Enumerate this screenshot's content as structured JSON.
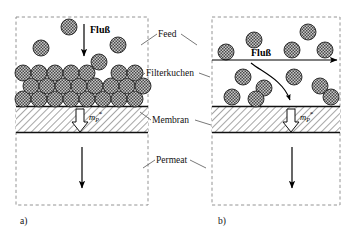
{
  "figure": {
    "title_present": false,
    "background_color": "#ffffff",
    "ink_color": "#111111",
    "panels": [
      {
        "id": "a",
        "caption": "a)",
        "box": {
          "x": 16,
          "y": 17,
          "w": 132,
          "h": 188
        },
        "flux_label": "Fluß",
        "flux_direction": "down",
        "mass_flow_label": {
          "symbol": "m",
          "subscript": "P",
          "superscript": "*"
        },
        "membrane": {
          "top": 106,
          "bottom": 133
        },
        "cake_rows": 3,
        "free_particles": 5
      },
      {
        "id": "b",
        "caption": "b)",
        "box": {
          "x": 212,
          "y": 17,
          "w": 128,
          "h": 188
        },
        "flux_label": "Fluß",
        "flux_direction": "right",
        "mass_flow_label": {
          "symbol": "m",
          "subscript": "P",
          "superscript": "*"
        },
        "membrane": {
          "top": 106,
          "bottom": 133
        },
        "cake_rows": 0,
        "free_particles": 13
      }
    ],
    "annotations": [
      {
        "name": "feed",
        "text": "Feed",
        "x": 158,
        "y": 37
      },
      {
        "name": "filterkuchen",
        "text": "Filterkuchen",
        "x": 146,
        "y": 76
      },
      {
        "name": "membran",
        "text": "Membran",
        "x": 152,
        "y": 123
      },
      {
        "name": "permeat",
        "text": "Permeat",
        "x": 156,
        "y": 163
      }
    ],
    "colors": {
      "line": "#111111",
      "dashed_box": "#777777",
      "particle_fill": "#b5b5b5",
      "particle_stroke": "#222222",
      "membrane_hatch": "#333333",
      "arrow": "#000000"
    }
  }
}
